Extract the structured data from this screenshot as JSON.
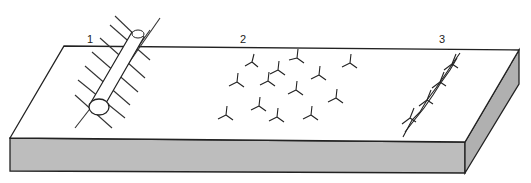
{
  "diagram": {
    "type": "illustration",
    "labels": [
      {
        "id": "1",
        "text": "1",
        "x": 89,
        "y": 34,
        "depicts": "spiked log"
      },
      {
        "id": "2",
        "text": "2",
        "x": 241,
        "y": 34,
        "depicts": "scattered caltrops"
      },
      {
        "id": "3",
        "text": "3",
        "x": 440,
        "y": 34,
        "depicts": "barbed wire strand"
      }
    ],
    "colors": {
      "line": "#222222",
      "top_face": "#ffffff",
      "side_face": "#bdbdbd"
    }
  }
}
